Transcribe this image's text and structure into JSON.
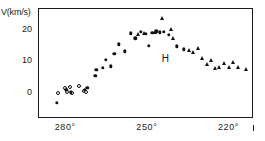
{
  "figure": {
    "y_axis_title": "V(km/s)",
    "annotation_label": "H"
  },
  "chart_data": {
    "type": "scatter",
    "title": "",
    "xlabel": "",
    "ylabel": "V(km/s)",
    "xlim": [
      290,
      211
    ],
    "ylim": [
      -8,
      27
    ],
    "x_ticks": [
      280,
      250,
      220
    ],
    "x_tick_labels": [
      "280°",
      "250°",
      "220°"
    ],
    "y_ticks": [
      0,
      10,
      20
    ],
    "y_tick_labels": [
      "0",
      "10",
      "20"
    ],
    "x_axis_direction": "decreasing",
    "grid": false,
    "legend": false,
    "annotations": [
      {
        "text": "H",
        "x": 243.2,
        "y": 11.2
      }
    ],
    "series": [
      {
        "name": "open-circles",
        "marker": "open-circle",
        "color": "#111111",
        "points": [
          {
            "x": 282.5,
            "y": 0.0
          },
          {
            "x": 280.2,
            "y": 1.5
          },
          {
            "x": 279.2,
            "y": 0.3
          },
          {
            "x": 278.4,
            "y": 1.8
          },
          {
            "x": 277.6,
            "y": 0.0
          },
          {
            "x": 274.9,
            "y": 2.3
          },
          {
            "x": 273.2,
            "y": 0.6
          },
          {
            "x": 272.4,
            "y": 0.4
          }
        ]
      },
      {
        "name": "filled-circles",
        "marker": "filled-circle",
        "color": "#111111",
        "points": [
          {
            "x": 283.0,
            "y": -3.2
          },
          {
            "x": 279.6,
            "y": 0.9
          },
          {
            "x": 277.9,
            "y": 0.2
          },
          {
            "x": 272.8,
            "y": 1.0
          },
          {
            "x": 271.9,
            "y": 1.6
          },
          {
            "x": 269.0,
            "y": 5.4
          },
          {
            "x": 268.6,
            "y": 7.4
          },
          {
            "x": 266.2,
            "y": 7.9
          },
          {
            "x": 265.0,
            "y": 10.6
          },
          {
            "x": 263.2,
            "y": 8.4
          },
          {
            "x": 261.9,
            "y": 12.4
          },
          {
            "x": 260.4,
            "y": 15.4
          },
          {
            "x": 258.2,
            "y": 13.2
          },
          {
            "x": 256.0,
            "y": 19.0
          },
          {
            "x": 254.3,
            "y": 17.3
          },
          {
            "x": 252.3,
            "y": 19.4
          },
          {
            "x": 250.5,
            "y": 18.7
          },
          {
            "x": 249.2,
            "y": 14.9
          },
          {
            "x": 248.0,
            "y": 19.1
          },
          {
            "x": 246.5,
            "y": 19.6
          },
          {
            "x": 245.2,
            "y": 19.3
          },
          {
            "x": 243.8,
            "y": 19.4
          },
          {
            "x": 242.0,
            "y": 18.5
          },
          {
            "x": 239.0,
            "y": 14.8
          },
          {
            "x": 236.5,
            "y": 13.9
          }
        ]
      },
      {
        "name": "triangles",
        "marker": "triangle",
        "color": "#111111",
        "points": [
          {
            "x": 253.2,
            "y": 18.6
          },
          {
            "x": 251.0,
            "y": 18.9
          },
          {
            "x": 247.0,
            "y": 19.4
          },
          {
            "x": 244.6,
            "y": 23.8
          },
          {
            "x": 241.3,
            "y": 20.3
          },
          {
            "x": 240.4,
            "y": 17.3
          },
          {
            "x": 234.6,
            "y": 13.7
          },
          {
            "x": 233.0,
            "y": 12.9
          },
          {
            "x": 231.3,
            "y": 14.4
          },
          {
            "x": 229.6,
            "y": 11.1
          },
          {
            "x": 228.0,
            "y": 9.3
          },
          {
            "x": 226.6,
            "y": 10.3
          },
          {
            "x": 225.0,
            "y": 8.0
          },
          {
            "x": 223.4,
            "y": 8.1
          },
          {
            "x": 221.5,
            "y": 9.6
          },
          {
            "x": 219.8,
            "y": 8.2
          },
          {
            "x": 218.2,
            "y": 9.8
          },
          {
            "x": 216.4,
            "y": 8.3
          },
          {
            "x": 213.4,
            "y": 7.6
          }
        ]
      }
    ]
  }
}
